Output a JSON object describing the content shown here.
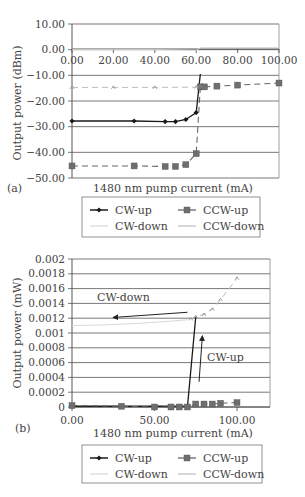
{
  "chart_data": [
    {
      "panel_label": "(a)",
      "type": "line",
      "xlabel": "1480 nm pump current (mA)",
      "ylabel": "Output power (dBm)",
      "xlim": [
        0,
        100
      ],
      "ylim": [
        -50,
        10
      ],
      "x_ticks": [
        "0.00",
        "20.00",
        "40.00",
        "60.00",
        "80.00",
        "100.00"
      ],
      "y_ticks": [
        "10.00",
        "0.00",
        "-10.00",
        "-20.00",
        "-30.00",
        "-40.00",
        "-50.00"
      ],
      "grid": true,
      "legend_position": "bottom",
      "legend": [
        "CW-up",
        "CCW-up",
        "CW-down",
        "CCW-down"
      ],
      "series": [
        {
          "name": "CW-up",
          "x": [
            0,
            30,
            45,
            50,
            55,
            60,
            62
          ],
          "y": [
            -27.8,
            -27.8,
            -28.0,
            -28.0,
            -27.2,
            -24.5,
            -9.5
          ]
        },
        {
          "name": "CCW-up",
          "x": [
            0,
            30,
            45,
            50,
            55,
            60,
            62,
            64,
            70,
            80,
            100
          ],
          "y": [
            -45.3,
            -45.3,
            -45.5,
            -45.5,
            -44.8,
            -40.5,
            -14.5,
            -14.5,
            -14.2,
            -13.8,
            -13.0
          ]
        },
        {
          "name": "CW-down",
          "x": [
            0,
            20,
            40,
            60,
            62,
            64,
            70,
            80,
            100
          ],
          "y": [
            0.0,
            0.0,
            0.0,
            -0.2,
            0.8,
            0.8,
            0.8,
            0.8,
            0.8
          ]
        },
        {
          "name": "CCW-down",
          "x": [
            0,
            20,
            40,
            60,
            62
          ],
          "y": [
            -14.7,
            -14.7,
            -14.7,
            -14.6,
            -14.5
          ]
        }
      ]
    },
    {
      "panel_label": "(b)",
      "type": "line",
      "xlabel": "1480 nm pump current (mA)",
      "ylabel": "Output power (mW)",
      "xlim": [
        0,
        120
      ],
      "ylim": [
        0,
        0.002
      ],
      "x_ticks": [
        "0.00",
        "50.00",
        "100.00"
      ],
      "y_ticks": [
        "0.002",
        "0.0018",
        "0.0016",
        "0.0014",
        "0.0012",
        "0.001",
        "0.0008",
        "0.0006",
        "0.0004",
        "0.0002",
        "0"
      ],
      "grid": true,
      "legend_position": "bottom",
      "legend": [
        "CW-up",
        "CCW-up",
        "CW-down",
        "CCW-down"
      ],
      "annotations": [
        {
          "text": "CW-down",
          "arrow_from": [
            70,
            0.00128
          ],
          "arrow_to": [
            25,
            0.00121
          ]
        },
        {
          "text": "CW-up",
          "arrow_from": [
            77,
            0.00034
          ],
          "arrow_to": [
            79,
            0.00096
          ]
        }
      ],
      "series": [
        {
          "name": "CW-up",
          "x": [
            0,
            30,
            50,
            60,
            65,
            70,
            75
          ],
          "y": [
            1e-05,
            1e-05,
            1e-05,
            1e-05,
            1e-05,
            1e-05,
            0.00122
          ]
        },
        {
          "name": "CCW-up",
          "x": [
            0,
            30,
            50,
            60,
            65,
            70,
            75,
            80,
            85,
            90,
            100
          ],
          "y": [
            2e-05,
            1e-05,
            0.0,
            0.0,
            0.0,
            0.0,
            4e-05,
            4e-05,
            4e-05,
            5e-05,
            6e-05
          ]
        },
        {
          "name": "CW-down",
          "x": [
            0,
            20,
            40,
            60,
            70
          ],
          "y": [
            0.0011,
            0.00111,
            0.00113,
            0.00116,
            0.00118
          ]
        },
        {
          "name": "CCW-down",
          "x": [
            72,
            75,
            80,
            85,
            90,
            100
          ],
          "y": [
            0.00119,
            0.00122,
            0.00125,
            0.00132,
            0.00145,
            0.00174
          ]
        }
      ]
    }
  ]
}
